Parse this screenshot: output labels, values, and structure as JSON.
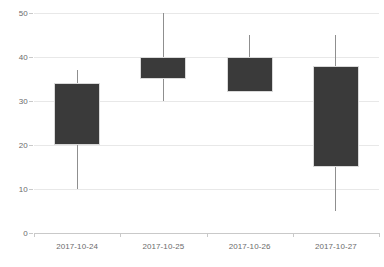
{
  "chart_data": {
    "type": "candlestick",
    "title": "",
    "xlabel": "",
    "ylabel": "",
    "categories": [
      "2017-10-24",
      "2017-10-25",
      "2017-10-26",
      "2017-10-27"
    ],
    "ylim": [
      0,
      50
    ],
    "yticks": [
      0,
      10,
      20,
      30,
      40,
      50
    ],
    "grid": true,
    "legend": "none",
    "series": [
      {
        "name": "price",
        "fields": [
          "open",
          "close",
          "low",
          "high"
        ],
        "points": [
          {
            "x": "2017-10-24",
            "open": 20,
            "close": 34,
            "low": 10,
            "high": 37
          },
          {
            "x": "2017-10-25",
            "open": 35,
            "close": 40,
            "low": 30,
            "high": 50
          },
          {
            "x": "2017-10-26",
            "open": 32,
            "close": 40,
            "low": 32,
            "high": 45
          },
          {
            "x": "2017-10-27",
            "open": 15,
            "close": 38,
            "low": 5,
            "high": 45
          }
        ]
      }
    ],
    "colors": {
      "body_fill": "#3a3a3a",
      "body_border": "#d9d9d9",
      "wick": "#8f8f8f",
      "gridline": "#e8e8e8",
      "axis": "#c9c9c9",
      "tick_text": "#6b6b6b",
      "background": "#ffffff"
    },
    "ytick_labels": [
      "0",
      "10",
      "20",
      "30",
      "40",
      "50"
    ]
  }
}
